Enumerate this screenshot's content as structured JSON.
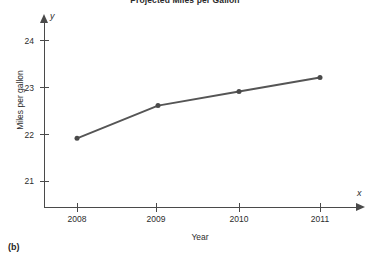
{
  "figure": {
    "panel_label": "(b)",
    "background_color": "#ffffff"
  },
  "chart_data": {
    "type": "line",
    "title": "Projected Miles per Gallon",
    "xlabel": "Year",
    "ylabel": "Miles per gallon",
    "x_axis_variable": "x",
    "y_axis_variable": "y",
    "categories": [
      "2008",
      "2009",
      "2010",
      "2011"
    ],
    "x": [
      2008,
      2009,
      2010,
      2011
    ],
    "values": [
      21.9,
      22.6,
      22.9,
      23.2
    ],
    "series": [
      {
        "name": "Projected miles per gallon",
        "values": [
          21.9,
          22.6,
          22.9,
          23.2
        ]
      }
    ],
    "xlim": [
      2007.58,
      2011.5
    ],
    "ylim": [
      20.42,
      24.35
    ],
    "x_ticks": [
      2008,
      2009,
      2010,
      2011
    ],
    "x_tick_labels": [
      "2008",
      "2009",
      "2010",
      "2011"
    ],
    "y_ticks": [
      21,
      22,
      23,
      24
    ],
    "y_tick_labels": [
      "21",
      "22",
      "23",
      "24"
    ],
    "grid": false,
    "legend": false,
    "legend_position": "none",
    "marker": "circle",
    "line_color": "#555555",
    "marker_color": "#4a4a4a",
    "axis_color": "#4a4a4a",
    "annotations": []
  }
}
